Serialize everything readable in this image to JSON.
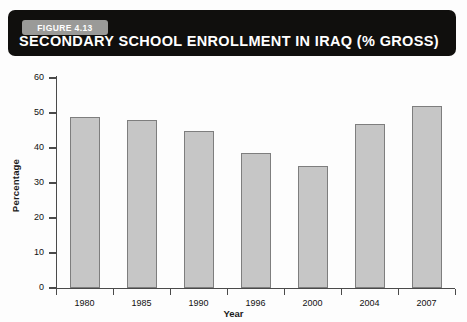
{
  "figure": {
    "tag_label": "FIGURE 4.13",
    "title": "SECONDARY SCHOOL ENROLLMENT IN IRAQ (% GROSS)",
    "banner_color": "#100f0d",
    "tag_color": "#9a9a98",
    "title_color": "#ffffff"
  },
  "chart_data": {
    "type": "bar",
    "title": "SECONDARY SCHOOL ENROLLMENT IN IRAQ (% GROSS)",
    "categories": [
      "1980",
      "1985",
      "1990",
      "1996",
      "2000",
      "2004",
      "2007"
    ],
    "values": [
      49,
      48,
      45,
      38.5,
      35,
      47,
      52
    ],
    "xlabel": "Year",
    "ylabel": "Percentage",
    "ylim": [
      0,
      60
    ],
    "yticks": [
      0,
      10,
      20,
      30,
      40,
      50,
      60
    ],
    "ytick_labels": [
      "0",
      "10",
      "20",
      "30",
      "40",
      "50",
      "60"
    ],
    "grid": false,
    "legend": null,
    "bar_color": "#c6c6c6",
    "bar_border_color": "#7e7e7e",
    "axis_color": "#4a4a4a"
  }
}
